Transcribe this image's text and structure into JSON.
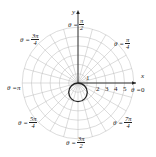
{
  "chart_data": {
    "type": "polar",
    "title": "",
    "curve": {
      "equation": "r = -2 sin θ",
      "description": "circle of diameter 2 below the pole",
      "color": "#222222"
    },
    "grid": {
      "rings": [
        1,
        2,
        3,
        4,
        5,
        6
      ],
      "spokes_deg_step": 15
    },
    "axis_labels": {
      "x": "x",
      "y": "y"
    },
    "radial_tick_labels": [
      "1",
      "2",
      "3",
      "4",
      "5"
    ],
    "angle_labels": [
      {
        "id": "a0",
        "prefix": "θ = ",
        "value": "0"
      },
      {
        "id": "a45",
        "prefix": "θ = ",
        "num": "π",
        "den": "4"
      },
      {
        "id": "a90",
        "prefix": "θ = ",
        "num": "π",
        "den": "2"
      },
      {
        "id": "a135",
        "prefix": "θ = ",
        "num": "3π",
        "den": "4"
      },
      {
        "id": "a180",
        "prefix": "θ = ",
        "value": "π"
      },
      {
        "id": "a225",
        "prefix": "θ = ",
        "num": "5π",
        "den": "4"
      },
      {
        "id": "a270",
        "prefix": "θ = ",
        "num": "3π",
        "den": "2"
      },
      {
        "id": "a315",
        "prefix": "θ = ",
        "num": "7π",
        "den": "4"
      }
    ]
  }
}
